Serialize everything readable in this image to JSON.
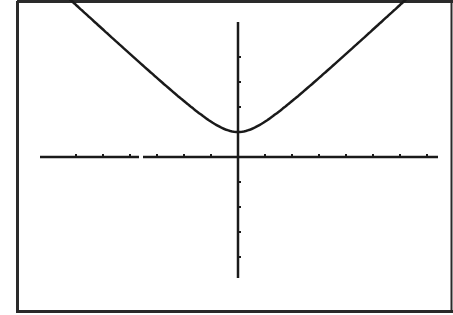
{
  "colors": {
    "background": "#ffffff",
    "ink": "#1a1a1a",
    "frame": "#2a2a2a"
  },
  "chart_data": {
    "type": "line",
    "title": "",
    "xlabel": "",
    "ylabel": "",
    "function": "y = sqrt(x^2 + 1)",
    "xlim": [
      -7.3,
      7.5
    ],
    "ylim": [
      -4.5,
      5.2
    ],
    "grid": false,
    "legend": null,
    "x_tick_step": 1,
    "y_tick_step": 1,
    "x_ticks_left": [
      -6,
      -5,
      -4,
      -3,
      -2,
      -1
    ],
    "x_ticks_right": [
      1,
      2,
      3,
      4,
      5,
      6,
      7
    ],
    "y_ticks_up": [
      1,
      2,
      3,
      4
    ],
    "y_ticks_down": [
      -1,
      -2,
      -3,
      -4
    ],
    "series": [
      {
        "name": "curve",
        "x": [
          -7.2,
          -6,
          -5,
          -4,
          -3,
          -2,
          -1,
          0,
          1,
          2,
          3,
          4,
          5,
          6,
          7.2
        ],
        "y": [
          7.27,
          6.08,
          5.1,
          4.12,
          3.16,
          2.24,
          1.41,
          1.0,
          1.41,
          2.24,
          3.16,
          4.12,
          5.1,
          6.08,
          7.27
        ]
      }
    ],
    "minimum": {
      "x": 0,
      "y": 1
    }
  }
}
